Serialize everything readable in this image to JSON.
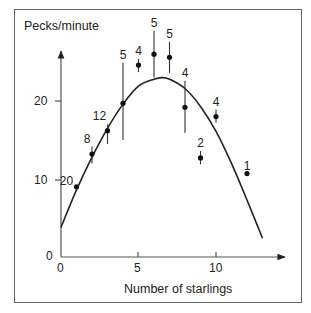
{
  "chart_data": {
    "type": "scatter",
    "title": "",
    "xlabel": "Number of starlings",
    "ylabel": "Pecks/minute",
    "xlim": [
      0,
      14
    ],
    "ylim": [
      0,
      27
    ],
    "x_ticks": [
      0,
      5,
      10
    ],
    "y_ticks": [
      0,
      10,
      20
    ],
    "grid": false,
    "legend": null,
    "series": [
      {
        "name": "Observed mean pecks/minute",
        "points": [
          {
            "x": 1,
            "y": 9.0,
            "n": 20,
            "err_low": 9.0,
            "err_high": 9.0
          },
          {
            "x": 2,
            "y": 13.2,
            "n": 8,
            "err_low": 12.0,
            "err_high": 14.2
          },
          {
            "x": 3,
            "y": 16.2,
            "n": 12,
            "err_low": 14.5,
            "err_high": 17.0
          },
          {
            "x": 4,
            "y": 19.7,
            "n": 5,
            "err_low": 15.0,
            "err_high": 24.9
          },
          {
            "x": 5,
            "y": 24.6,
            "n": 4,
            "err_low": 23.7,
            "err_high": 25.4
          },
          {
            "x": 6,
            "y": 26.0,
            "n": 5,
            "err_low": 23.0,
            "err_high": 29.0
          },
          {
            "x": 7,
            "y": 25.6,
            "n": 5,
            "err_low": 23.6,
            "err_high": 27.6
          },
          {
            "x": 8,
            "y": 19.2,
            "n": 4,
            "err_low": 15.9,
            "err_high": 22.6
          },
          {
            "x": 9,
            "y": 12.7,
            "n": 2,
            "err_low": 11.9,
            "err_high": 13.6
          },
          {
            "x": 10,
            "y": 18.0,
            "n": 4,
            "err_low": 17.2,
            "err_high": 18.9
          },
          {
            "x": 12,
            "y": 10.7,
            "n": 1,
            "err_low": 10.7,
            "err_high": 10.7
          }
        ]
      },
      {
        "name": "Fitted curve",
        "type": "line",
        "points": [
          {
            "x": 0,
            "y": 3.8
          },
          {
            "x": 1,
            "y": 8.6
          },
          {
            "x": 2,
            "y": 12.8
          },
          {
            "x": 3,
            "y": 16.5
          },
          {
            "x": 4,
            "y": 19.6
          },
          {
            "x": 5,
            "y": 21.9
          },
          {
            "x": 6,
            "y": 22.8
          },
          {
            "x": 6.5,
            "y": 23.0
          },
          {
            "x": 7,
            "y": 22.8
          },
          {
            "x": 8,
            "y": 21.6
          },
          {
            "x": 9,
            "y": 19.3
          },
          {
            "x": 10,
            "y": 16.1
          },
          {
            "x": 11,
            "y": 12.0
          },
          {
            "x": 12,
            "y": 7.3
          },
          {
            "x": 13,
            "y": 2.4
          }
        ]
      }
    ],
    "annotations": [
      "20",
      "8",
      "12",
      "5",
      "4",
      "5",
      "5",
      "4",
      "2",
      "4",
      "1"
    ]
  },
  "labels": {
    "y_axis": "Pecks/minute",
    "x_axis": "Number of starlings",
    "y_tick_0": "0",
    "y_tick_10": "10",
    "y_tick_20": "20",
    "x_tick_0": "0",
    "x_tick_5": "5",
    "x_tick_10": "10"
  }
}
